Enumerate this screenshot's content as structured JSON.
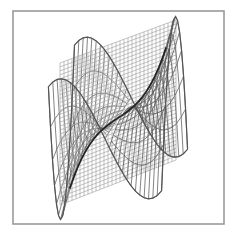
{
  "frame": {
    "x": 13,
    "y": 11,
    "width": 211,
    "height": 213,
    "stroke": "#9a9a9a"
  },
  "colors": {
    "background": "#ffffff",
    "plane_grid": "#a8a8a8",
    "surface_mesh": "#5a5a5a",
    "intersection_curve": "#222222"
  },
  "plane": {
    "corners": [
      [
        60,
        63
      ],
      [
        176,
        20
      ],
      [
        176,
        160
      ],
      [
        60,
        205
      ]
    ],
    "u_lines": 29,
    "v_lines": 36
  },
  "surface": {
    "u_count": 26,
    "v_count": 13,
    "origin": [
      118,
      118
    ],
    "u_axis": [
      3.9,
      -1.25
    ],
    "v_axis": [
      -1.0,
      1.6
    ],
    "z_scale": 42,
    "u_range": [
      -1.45,
      1.45
    ],
    "v_range": [
      -1.3,
      1.3
    ]
  }
}
